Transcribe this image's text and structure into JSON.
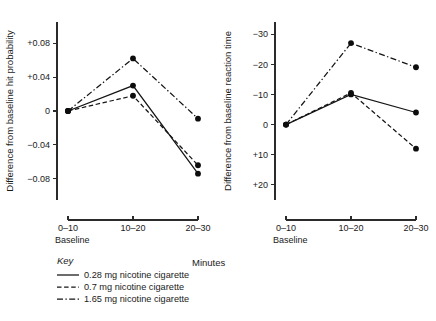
{
  "figure": {
    "shared_xlabel": "Minutes",
    "baseline_note": "Baseline"
  },
  "legend": {
    "title": "Key",
    "entries": [
      {
        "label": "0.28 mg nicotine cigarette",
        "style": "solid"
      },
      {
        "label": "0.7 mg nicotine cigarette",
        "style": "dashed"
      },
      {
        "label": "1.65 mg nicotine cigarette",
        "style": "dashdot"
      }
    ]
  },
  "chart_data": [
    {
      "type": "line",
      "title": "",
      "xlabel": "Minutes",
      "ylabel": "Difference from baseline hit probability",
      "categories": [
        "0–10",
        "10–20",
        "20–30"
      ],
      "xtick_labels": [
        "0–10",
        "10–20",
        "20–30"
      ],
      "ytick_labels": [
        "+0.08",
        "+0.04",
        "0",
        "−0.04",
        "−0.08"
      ],
      "ytick_values": [
        0.08,
        0.04,
        0,
        -0.04,
        -0.08
      ],
      "ylim": [
        -0.105,
        0.105
      ],
      "y_inverted": false,
      "grid": false,
      "legend_position": "below-left",
      "series": [
        {
          "name": "0.28 mg nicotine cigarette",
          "style": "solid",
          "values": [
            0.0,
            0.03,
            -0.074
          ]
        },
        {
          "name": "0.7 mg nicotine cigarette",
          "style": "dashed",
          "values": [
            0.0,
            0.018,
            -0.064
          ]
        },
        {
          "name": "1.65 mg nicotine cigarette",
          "style": "dashdot",
          "values": [
            0.0,
            0.062,
            -0.009
          ]
        }
      ]
    },
    {
      "type": "line",
      "title": "",
      "xlabel": "Minutes",
      "ylabel": "Difference from baseline reaction time",
      "categories": [
        "0–10",
        "10–20",
        "20–30"
      ],
      "xtick_labels": [
        "0–10",
        "10–20",
        "20–30"
      ],
      "ytick_labels": [
        "−30",
        "−20",
        "−10",
        "0",
        "+10",
        "+20"
      ],
      "ytick_values": [
        -30,
        -20,
        -10,
        0,
        10,
        20
      ],
      "ylim": [
        -34,
        25
      ],
      "y_inverted": true,
      "grid": false,
      "legend_position": "below-left",
      "series": [
        {
          "name": "0.28 mg nicotine cigarette",
          "style": "solid",
          "values": [
            0.0,
            -10.0,
            -4.0
          ]
        },
        {
          "name": "0.7 mg nicotine cigarette",
          "style": "dashed",
          "values": [
            0.0,
            -10.5,
            8.0
          ]
        },
        {
          "name": "1.65 mg nicotine cigarette",
          "style": "dashdot",
          "values": [
            0.0,
            -27.0,
            -19.0
          ]
        }
      ]
    }
  ]
}
